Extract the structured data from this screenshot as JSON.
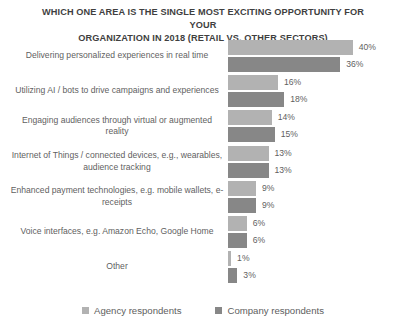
{
  "chart_data": {
    "type": "bar",
    "title": "WHICH ONE AREA IS THE SINGLE MOST EXCITING OPPORTUNITY FOR YOUR ORGANIZATION IN 2018 (RETAIL VS. OTHER SECTORS)",
    "title_line1": "WHICH ONE AREA IS THE SINGLE MOST EXCITING OPPORTUNITY FOR YOUR",
    "title_line2": "ORGANIZATION IN 2018 (RETAIL VS. OTHER SECTORS)",
    "orientation": "horizontal",
    "grouped": true,
    "xlabel": "",
    "ylabel": "",
    "xlim": [
      0,
      40
    ],
    "grid": false,
    "legend_position": "bottom",
    "categories": [
      "Delivering personalized experiences in real time",
      "Utilizing AI / bots to drive campaigns and experiences",
      "Engaging audiences through virtual or augmented reality",
      "Internet of Things / connected devices, e.g., wearables, audience tracking",
      "Enhanced payment technologies, e.g. mobile wallets, e-receipts",
      "Voice interfaces, e.g. Amazon Echo, Google Home",
      "Other"
    ],
    "series": [
      {
        "name": "Agency respondents",
        "color": "#b2b2b2",
        "values": [
          40,
          16,
          14,
          13,
          9,
          6,
          1
        ],
        "labels": [
          "40%",
          "16%",
          "14%",
          "13%",
          "9%",
          "6%",
          "1%"
        ]
      },
      {
        "name": "Company respondents",
        "color": "#878787",
        "values": [
          36,
          18,
          15,
          13,
          9,
          6,
          3
        ],
        "labels": [
          "36%",
          "18%",
          "15%",
          "13%",
          "9%",
          "6%",
          "3%"
        ]
      }
    ]
  },
  "legend": {
    "items": [
      {
        "label": "Agency respondents",
        "color": "#b2b2b2"
      },
      {
        "label": "Company respondents",
        "color": "#878787"
      }
    ]
  }
}
